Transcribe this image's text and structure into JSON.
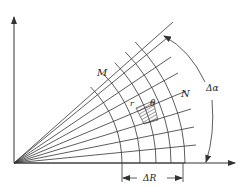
{
  "diagram": {
    "type": "polar-grid-schematic",
    "origin": {
      "x": 14,
      "y": 163
    },
    "radial_line_angles_deg": [
      0,
      5.6,
      11.2,
      16.8,
      22.4,
      28,
      33.6,
      39.2,
      44.8
    ],
    "radial_line_length": 214,
    "arc_radii": [
      108,
      126,
      142,
      157,
      171
    ],
    "labels": {
      "M": "M",
      "N": "N",
      "r": "r",
      "theta": "θ",
      "delta_alpha": "Δα",
      "delta_R": "ΔR"
    },
    "colors": {
      "line": "#333333",
      "background": "#ffffff"
    }
  }
}
